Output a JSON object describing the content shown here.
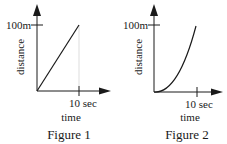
{
  "figures": [
    {
      "caption": "Figure 1",
      "y_label": "distance",
      "x_label": "time",
      "y_tick_label": "100m",
      "x_tick_label": "10 sec",
      "curve": "linear",
      "description": "Straight line from origin to (10 sec, 100m)"
    },
    {
      "caption": "Figure 2",
      "y_label": "distance",
      "x_label": "time",
      "y_tick_label": "100m",
      "x_tick_label": "10 sec",
      "curve": "quadratic",
      "description": "Upward-curving line from origin to (10 sec, 100m)"
    }
  ],
  "colors": {
    "ink": "#1a1a1a",
    "background": "#ffffff"
  }
}
